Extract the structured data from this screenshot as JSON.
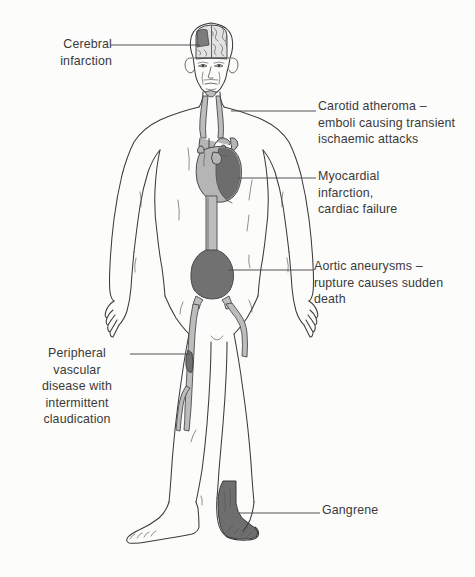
{
  "figure": {
    "background_color": "#fcfcfb",
    "ink_color": "#3a3a3a",
    "tone_light": "#b9b9b9",
    "tone_dark": "#6e6e6e"
  },
  "annotations": {
    "cerebral": {
      "label": "Cerebral\ninfarction",
      "align": "right"
    },
    "carotid": {
      "label": "Carotid atheroma –\nemboli causing transient\nischaemic attacks",
      "align": "left"
    },
    "myocardial": {
      "label": "Myocardial\ninfarction,\ncardiac failure",
      "align": "left"
    },
    "aortic": {
      "label": "Aortic aneurysms –\nrupture causes sudden\ndeath",
      "align": "left"
    },
    "peripheral": {
      "label": "Peripheral\nvascular\ndisease with\nintermittent\nclaudication",
      "align": "center"
    },
    "gangrene": {
      "label": "Gangrene",
      "align": "left"
    }
  },
  "anatomy": {
    "brain": "brain-sagittal-section",
    "brain_infarct": "cerebral-infarct-wedge",
    "carotid_arteries": "carotid-artery-pair",
    "heart": "heart-organ",
    "heart_infarct": "myocardial-infarct-region",
    "aorta": "descending-aorta",
    "aortic_aneurysm": "abdominal-aortic-aneurysm",
    "iliac_arteries": "iliac-artery-bifurcation",
    "leg_arteries": "femoral-popliteal-arteries",
    "arterial_stenosis": "femoral-artery-stenosis",
    "gangrenous_foot": "gangrenous-foot",
    "body_outline": "male-body-outline-anterior"
  },
  "leader_lines": {
    "cerebral": "leader-line-cerebral",
    "carotid": "leader-line-carotid",
    "myocardial": "leader-line-myocardial",
    "aortic": "leader-line-aortic",
    "peripheral": "leader-line-peripheral",
    "gangrene": "leader-line-gangrene"
  }
}
